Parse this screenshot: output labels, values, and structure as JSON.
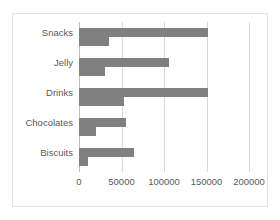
{
  "chart_data": {
    "type": "bar",
    "orientation": "horizontal",
    "title": "",
    "xlabel": "",
    "ylabel": "",
    "categories": [
      "Snacks",
      "Jelly",
      "Drinks",
      "Chocolates",
      "Biscuits"
    ],
    "series": [
      {
        "name": "Series 1",
        "values": [
          152000,
          106000,
          152000,
          55000,
          65000
        ]
      },
      {
        "name": "Series 2",
        "values": [
          35000,
          30000,
          53000,
          20000,
          10000
        ]
      }
    ],
    "xlim": [
      0,
      200000
    ],
    "xticks": [
      0,
      50000,
      100000,
      150000,
      200000
    ],
    "xtick_labels": [
      "0",
      "50000",
      "100000",
      "150000",
      "200000"
    ],
    "grid": "vertical",
    "legend": "none",
    "bar_color": "#808080",
    "gridline_color": "#d9d9d9",
    "label_color": "#595959",
    "frame_color": "#e2e2e2"
  }
}
